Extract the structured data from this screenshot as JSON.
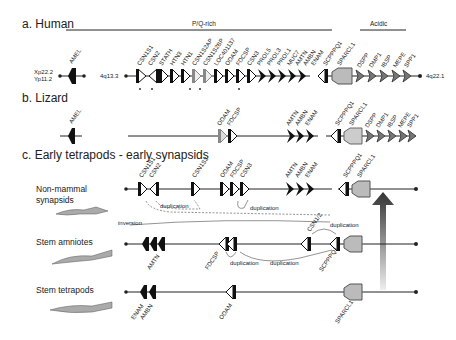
{
  "panels": {
    "a": {
      "title": "a. Human",
      "regions": {
        "pq": "P/Q-rich",
        "acidic": "Acidic"
      },
      "amel_loci": [
        "Xp22.2",
        "Yp11.2"
      ],
      "amel_gene": "AMEL",
      "left_locus": "4q13.3",
      "right_locus": "4q22.1",
      "genes": [
        "CSN1S1",
        "CSN2",
        "STATH",
        "HTN3",
        "HTN1",
        "CSN1S2AP",
        "CSN1S2BP",
        "LOC401137",
        "ODAM",
        "FDCSP",
        "CSN3",
        "PROL5",
        "PROL3",
        "PROL1",
        "MUC7",
        "AMTN",
        "AMBN",
        "ENAM",
        "SCPPPQ1",
        "SPARCL1",
        "DSPP",
        "DMP1",
        "IBSP",
        "MEPE",
        "SPP1"
      ]
    },
    "b": {
      "title": "b. Lizard",
      "amel_gene": "AMEL",
      "genes": [
        "ODAM",
        "FDCSP",
        "AMTN",
        "AMBN",
        "ENAM",
        "SCPPPQ1",
        "SPARCL1",
        "DSPP",
        "DMP1",
        "IBSP",
        "MEPE",
        "SPP1"
      ]
    },
    "c": {
      "title": "c. Early tetrapods - early synapsids",
      "rows": [
        {
          "label_line1": "Non-mammal",
          "label_line2": "synapsids",
          "genes": [
            "CSN1S1",
            "CSN2",
            "CSN1S2",
            "ODAM",
            "FDCSP",
            "CSN3",
            "AMTN",
            "AMBN",
            "ENAM",
            "SCPPPQ1",
            "SPARCL1"
          ]
        },
        {
          "label_line1": "Stem amniotes",
          "genes": [
            "AMTN",
            "FDCSP",
            "CSN1/2",
            "SCPPPQ1"
          ]
        },
        {
          "label_line1": "Stem tetrapods",
          "genes": [
            "ENAM",
            "AMBN",
            "ODAM",
            "SPARCL1"
          ]
        }
      ],
      "annotations": {
        "duplication": "duplication",
        "inversion": "inversion"
      }
    }
  }
}
